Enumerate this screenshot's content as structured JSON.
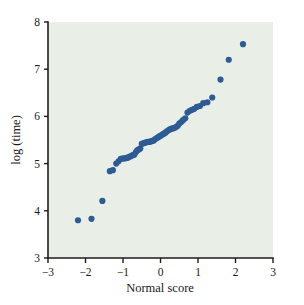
{
  "figure": {
    "background_color": "#ffffff",
    "plot_background_color": "#e9efe6",
    "point_color": "#2d5b94",
    "axis_color": "#1c1c1c"
  },
  "chart_data": {
    "type": "scatter",
    "title": "",
    "subtitle": "",
    "xlabel": "Normal score",
    "ylabel": "log (time)",
    "xlim": [
      -3,
      3
    ],
    "ylim": [
      3,
      8
    ],
    "xticks": [
      -3,
      -2,
      -1,
      0,
      1,
      2,
      3
    ],
    "xticklabels": [
      "−3",
      "−2",
      "−1",
      "0",
      "1",
      "2",
      "3"
    ],
    "yticks": [
      3,
      4,
      5,
      6,
      7,
      8
    ],
    "yticklabels": [
      "3",
      "4",
      "5",
      "6",
      "7",
      "8"
    ],
    "grid": false,
    "legend": null,
    "marker": "filled-circle",
    "marker_size": 3.1,
    "n_points": 61,
    "series": [
      {
        "name": "log(time) vs normal score",
        "color": "#2d5b94",
        "x": [
          -2.2,
          -1.84,
          -1.55,
          -1.35,
          -1.27,
          -1.18,
          -1.12,
          -1.06,
          -1.0,
          -0.95,
          -0.9,
          -0.86,
          -0.82,
          -0.78,
          -0.74,
          -0.7,
          -0.66,
          -0.62,
          -0.58,
          -0.54,
          -0.5,
          -0.46,
          -0.42,
          -0.38,
          -0.34,
          -0.3,
          -0.26,
          -0.22,
          -0.18,
          -0.14,
          -0.1,
          -0.06,
          -0.02,
          0.02,
          0.06,
          0.1,
          0.14,
          0.18,
          0.22,
          0.26,
          0.3,
          0.34,
          0.38,
          0.42,
          0.46,
          0.5,
          0.55,
          0.6,
          0.66,
          0.72,
          0.78,
          0.84,
          0.9,
          0.97,
          1.05,
          1.14,
          1.25,
          1.38,
          1.6,
          1.82,
          2.2
        ],
        "y": [
          3.8,
          3.83,
          4.21,
          4.84,
          4.86,
          5.0,
          5.05,
          5.1,
          5.11,
          5.11,
          5.12,
          5.13,
          5.15,
          5.16,
          5.18,
          5.19,
          5.24,
          5.28,
          5.3,
          5.32,
          5.42,
          5.43,
          5.44,
          5.45,
          5.46,
          5.46,
          5.47,
          5.48,
          5.49,
          5.52,
          5.54,
          5.56,
          5.58,
          5.6,
          5.62,
          5.64,
          5.66,
          5.69,
          5.71,
          5.73,
          5.74,
          5.75,
          5.76,
          5.78,
          5.8,
          5.85,
          5.88,
          5.92,
          5.96,
          6.08,
          6.12,
          6.14,
          6.16,
          6.2,
          6.22,
          6.28,
          6.3,
          6.4,
          6.78,
          7.2,
          7.53
        ]
      }
    ]
  }
}
